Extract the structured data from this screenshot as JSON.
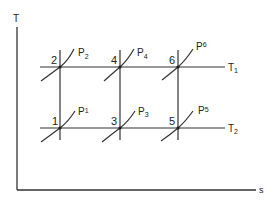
{
  "diagram": {
    "type": "T-s diagram",
    "axes": {
      "y_label": "T",
      "x_label": "s"
    },
    "isotherms": [
      {
        "id": "T1",
        "label": "T",
        "subscript": "1",
        "y": 67
      },
      {
        "id": "T2",
        "label": "T",
        "subscript": "2",
        "y": 128
      }
    ],
    "states": [
      {
        "number": "2",
        "x": 60,
        "y": 67,
        "isobar": {
          "label": "P",
          "subscript": "2"
        }
      },
      {
        "number": "4",
        "x": 120,
        "y": 67,
        "isobar": {
          "label": "P",
          "subscript": "4"
        }
      },
      {
        "number": "6",
        "x": 178,
        "y": 67,
        "isobar": {
          "label": "P",
          "subscript": "6"
        }
      },
      {
        "number": "1",
        "x": 60,
        "y": 128,
        "isobar": {
          "label": "P",
          "subscript": "1"
        }
      },
      {
        "number": "3",
        "x": 120,
        "y": 128,
        "isobar": {
          "label": "P",
          "subscript": "3"
        }
      },
      {
        "number": "5",
        "x": 178,
        "y": 128,
        "isobar": {
          "label": "P",
          "subscript": "5"
        }
      }
    ],
    "colors": {
      "line": "#333333",
      "background": "#ffffff"
    }
  }
}
